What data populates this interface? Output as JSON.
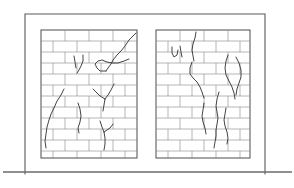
{
  "figure": {
    "description": "Line drawing of two brick masonry wall panels set in a wall frame, each showing diagonal and vertical crack patterns typical of settlement damage",
    "type": "technical-line-drawing",
    "colors": {
      "background": "#ffffff",
      "frame_stroke": "#5a5a5a",
      "ground_stroke": "#6a6a6a",
      "panel_stroke": "#4d4d4d",
      "mortar_stroke": "#8a8a8a",
      "crack_stroke": "#3a3a3a"
    },
    "canvas": {
      "width": 294,
      "height": 188
    }
  },
  "frame": {
    "name": "wall-frame",
    "left_x": 25,
    "top_y": 14,
    "right_x": 265,
    "bottom_y": 174,
    "ground_line_y": 172,
    "ground_line_x1": 3,
    "ground_line_x2": 292
  },
  "panels": [
    {
      "id": "left-panel",
      "label": "Left masonry panel",
      "x": 41,
      "y": 30,
      "width": 96,
      "height": 128,
      "course_height": 11.0,
      "courses": 12,
      "brick_length": 24,
      "bond": "running-bond",
      "crack_count": 6
    },
    {
      "id": "right-panel",
      "label": "Right masonry panel",
      "x": 156,
      "y": 30,
      "width": 94,
      "height": 128,
      "course_height": 11.0,
      "courses": 12,
      "brick_length": 24,
      "bond": "running-bond",
      "crack_count": 6
    }
  ],
  "cracks": {
    "left_panel": [
      {
        "id": "lp-crack-1",
        "kind": "diagonal-stair-step",
        "location": "upper-right",
        "path": "M136,33 L129,40 L125,46 L121,51 L117,55 L113,60 L111,64 L108,68 L106,71"
      },
      {
        "id": "lp-crack-2",
        "kind": "horizontal-step",
        "location": "upper-right-mid",
        "path": "M106,71 L100,71 L97,68 L95,64 L98,61 L102,60 L107,62 L112,63 L118,63 L124,61 L129,59"
      },
      {
        "id": "lp-crack-3",
        "kind": "short-vertical-pair",
        "location": "upper-centre",
        "path": "M74,56 L75,62 L76,68 M83,55 L83,61 L81,66 L79,70 L77,73"
      },
      {
        "id": "lp-crack-4",
        "kind": "long-diagonal",
        "location": "lower-left",
        "path": "M64,89 L61,95 L57,101 L54,108 L51,114 L49,120 L47,127 L46,134 L45,141 L46,148"
      },
      {
        "id": "lp-crack-5",
        "kind": "vertical-wavy",
        "location": "lower-centre",
        "path": "M78,103 L80,109 L81,116 L80,122 L78,128 L79,133"
      },
      {
        "id": "lp-crack-6",
        "kind": "branching-y",
        "location": "centre-right",
        "path": "M114,84 L111,90 L108,95 L105,99 M105,99 L100,96 L96,92 L93,89 M105,99 L104,105 L103,111"
      },
      {
        "id": "lp-crack-7",
        "kind": "branching-y-lower",
        "location": "lower-right",
        "path": "M100,121 L102,127 L104,132 M104,132 L110,128 L113,124 M104,132 L105,138 L105,144 L104,150"
      }
    ],
    "right_panel": [
      {
        "id": "rp-crack-1",
        "kind": "vertical-wavy",
        "location": "upper-centre",
        "path": "M196,32 L195,38 L193,44 L192,50 L193,56 L194,61"
      },
      {
        "id": "rp-crack-2",
        "kind": "short-hook",
        "location": "upper-left",
        "path": "M172,47 L172,53 L174,57 L177,55 L178,50 M180,46 L181,52 L182,57"
      },
      {
        "id": "rp-crack-3",
        "kind": "diagonal-stair",
        "location": "centre-left",
        "path": "M192,62 L190,68 L190,74 L193,78 L197,82 L200,87 L202,92 L204,98"
      },
      {
        "id": "rp-crack-4",
        "kind": "double-vertical-wavy",
        "location": "upper-right",
        "path": "M228,55 L226,61 L225,68 L226,75 L229,81 L232,87 L234,93 L235,99 M236,57 L239,63 L241,70 L241,77 L239,83 L237,89 L236,95"
      },
      {
        "id": "rp-crack-5",
        "kind": "vertical-long",
        "location": "centre",
        "path": "M219,92 L217,99 L216,106 L217,112 L218,118 L217,124 L216,130 L216,136 L215,142 L214,148"
      },
      {
        "id": "rp-crack-6",
        "kind": "vertical-short",
        "location": "lower-centre-left",
        "path": "M204,103 L203,110 L202,116 L203,122 L205,128 L206,134"
      },
      {
        "id": "rp-crack-7",
        "kind": "vertical-lower",
        "location": "lower-right",
        "path": "M226,108 L225,114 L224,120 L225,126 L227,132 L228,138 L227,144"
      }
    ]
  }
}
